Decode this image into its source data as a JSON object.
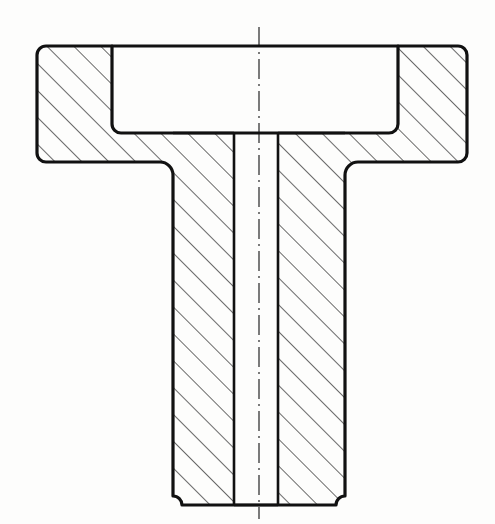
{
  "document": {
    "title": "Sectional View of Flanged Hub",
    "drawing_type": "engineering-cross-section",
    "view_name": "full-section",
    "background_color": "#fdfdfc",
    "line_color": "#111111",
    "hatch_color": "#1a1a1a",
    "canvas": {
      "width": 495,
      "height": 524
    }
  },
  "geometry": {
    "flange": {
      "label": "flange",
      "left": 37,
      "right": 467,
      "top": 46,
      "bottom": 162,
      "corner_radius": 9,
      "outline_width": 3.2
    },
    "pocket": {
      "label": "counterbore-recess",
      "left": 112,
      "right": 398,
      "top": 46,
      "bottom": 133,
      "corner_radius": 9,
      "note": "open at top face, un-hatched void"
    },
    "stem": {
      "label": "hub-stem",
      "left": 173,
      "right": 345,
      "top": 133,
      "bottom": 505,
      "fillet_radius": 13,
      "bottom_corner_radius": 9
    },
    "bore": {
      "label": "through-bore",
      "left": 234,
      "right": 278,
      "top": 133,
      "bottom": 505,
      "width": 44,
      "note": "through hole, un-hatched"
    },
    "centerline": {
      "label": "axis-of-symmetry",
      "x": 259,
      "top": 27,
      "bottom": 519,
      "pattern": "dash-dot",
      "dash_array": "20 5 2 5",
      "stroke_width": 1.1
    },
    "hatching": {
      "angle_degrees": 45,
      "direction": "up-to-the-right",
      "spacing": 19,
      "stroke_width": 1.3
    }
  },
  "regions": [
    {
      "name": "flange-left-wing",
      "hatched": true
    },
    {
      "name": "flange-right-wing",
      "hatched": true
    },
    {
      "name": "flange-floor-left",
      "hatched": true
    },
    {
      "name": "flange-floor-right",
      "hatched": true
    },
    {
      "name": "stem-wall-left",
      "hatched": true
    },
    {
      "name": "stem-wall-right",
      "hatched": true
    },
    {
      "name": "counterbore-recess",
      "hatched": false
    },
    {
      "name": "through-bore",
      "hatched": false
    }
  ]
}
